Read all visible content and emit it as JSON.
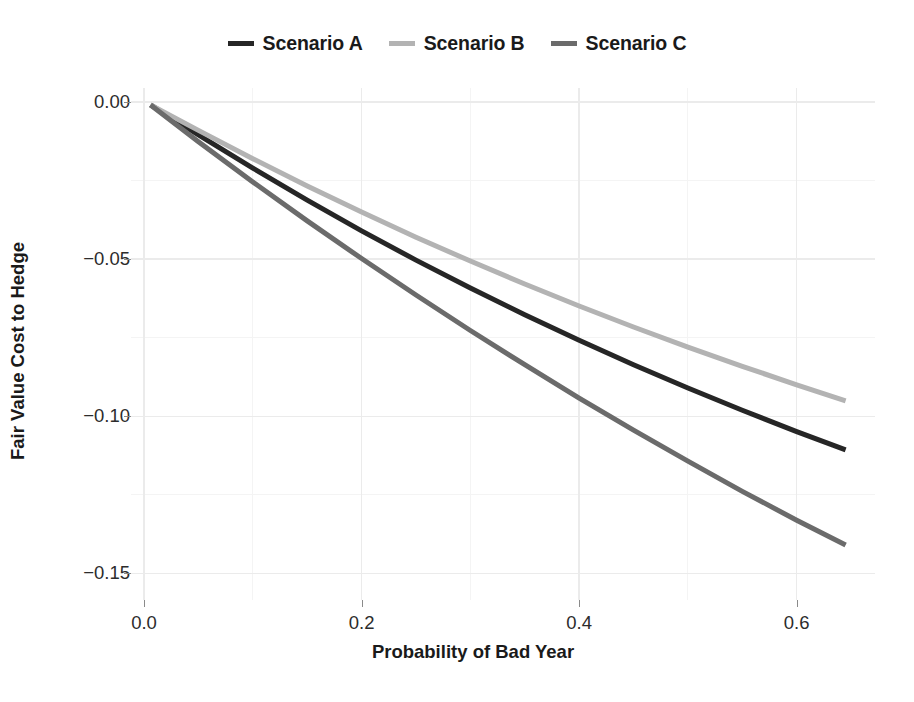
{
  "chart_data": {
    "type": "line",
    "title": "",
    "xlabel": "Probability of Bad Year",
    "ylabel": "Fair Value Cost to Hedge",
    "xlim": [
      -0.012,
      0.672
    ],
    "ylim": [
      -0.1585,
      0.0045
    ],
    "xticks": [
      0.0,
      0.2,
      0.4,
      0.6
    ],
    "xticklabels": [
      "0.0",
      "0.2",
      "0.4",
      "0.6"
    ],
    "yticks": [
      0.0,
      -0.05,
      -0.1,
      -0.15
    ],
    "yticklabels": [
      "0.00",
      "-0.05",
      "-0.10",
      "-0.15"
    ],
    "grid": true,
    "legend_position": "top",
    "x": [
      0.006,
      0.05,
      0.1,
      0.15,
      0.2,
      0.25,
      0.3,
      0.35,
      0.4,
      0.45,
      0.5,
      0.55,
      0.6,
      0.645
    ],
    "series": [
      {
        "name": "Scenario A",
        "color": "#262626",
        "values": [
          -0.0009,
          -0.0104,
          -0.021,
          -0.0312,
          -0.041,
          -0.0503,
          -0.0592,
          -0.0677,
          -0.0758,
          -0.0836,
          -0.091,
          -0.0981,
          -0.1049,
          -0.1107
        ]
      },
      {
        "name": "Scenario B",
        "color": "#b3b3b3",
        "values": [
          -0.0009,
          -0.009,
          -0.018,
          -0.0267,
          -0.035,
          -0.043,
          -0.0506,
          -0.0579,
          -0.0649,
          -0.0716,
          -0.078,
          -0.0841,
          -0.09,
          -0.0951
        ]
      },
      {
        "name": "Scenario C",
        "color": "#6b6b6b",
        "values": [
          -0.0009,
          -0.0126,
          -0.0254,
          -0.0378,
          -0.0498,
          -0.0614,
          -0.0727,
          -0.0836,
          -0.0942,
          -0.1044,
          -0.1143,
          -0.1239,
          -0.1331,
          -0.141
        ]
      }
    ]
  },
  "legend": {
    "entries": [
      {
        "label": "Scenario A",
        "color": "#262626"
      },
      {
        "label": "Scenario B",
        "color": "#b3b3b3"
      },
      {
        "label": "Scenario C",
        "color": "#6b6b6b"
      }
    ]
  },
  "axes": {
    "x_title": "Probability of Bad Year",
    "y_title": "Fair Value Cost to Hedge"
  },
  "colors": {
    "panel_background": "#ffffff",
    "major_gridline": "#ebebeb",
    "minor_gridline": "#f4f4f4",
    "tick_text": "#2c2c2c",
    "axis_title": "#1a1a1a"
  }
}
